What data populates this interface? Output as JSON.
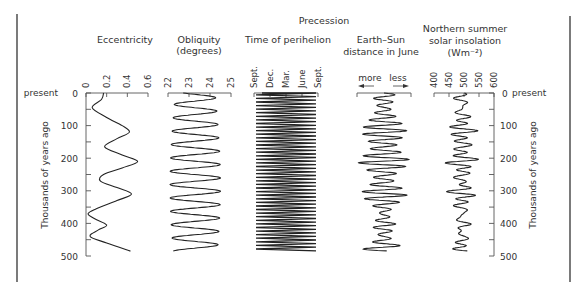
{
  "chart_data": {
    "type": "line",
    "title": "",
    "orientation": "vertical (time runs downward)",
    "y_axis": {
      "label": "Thousands of years ago",
      "ticks": [
        0,
        100,
        200,
        300,
        400,
        500
      ],
      "tick_labels": [
        "0",
        "100",
        "200",
        "300",
        "400",
        "500"
      ],
      "top_label": "present",
      "range": [
        0,
        500
      ]
    },
    "panels": [
      {
        "name": "Eccentricity",
        "title_lines": [
          "Eccentricity"
        ],
        "x_ticks": [
          "0",
          "0.2",
          "0.4",
          "0.6"
        ],
        "x_range": [
          0,
          0.06
        ],
        "series": {
          "t": [
            0,
            20,
            45,
            75,
            100,
            120,
            140,
            165,
            190,
            210,
            230,
            250,
            270,
            290,
            310,
            330,
            355,
            370,
            385,
            405,
            420,
            440,
            460,
            485
          ],
          "value": [
            0.017,
            0.015,
            0.006,
            0.02,
            0.035,
            0.042,
            0.03,
            0.018,
            0.035,
            0.05,
            0.035,
            0.017,
            0.014,
            0.03,
            0.044,
            0.03,
            0.01,
            0.002,
            0.008,
            0.02,
            0.012,
            0.004,
            0.02,
            0.043
          ]
        }
      },
      {
        "name": "Obliquity",
        "title_lines": [
          "Obliquity",
          "(degrees)"
        ],
        "x_ticks": [
          "22",
          "23",
          "24",
          "25"
        ],
        "x_range": [
          22,
          25
        ],
        "period_kyr": 41,
        "series_hint": "oscillation between ~22.1 and ~24.5 degrees with ~41 kyr period"
      },
      {
        "name": "Time of perihelion",
        "group_title": "Precession",
        "title_lines": [
          "Time of perihelion"
        ],
        "x_ticks": [
          "Sept.",
          "Dec.",
          "Mar.",
          "June",
          "Sept."
        ],
        "period_kyr": 22,
        "series_hint": "sawtooth sweeping Sept. to Sept. every ~22 kyr"
      },
      {
        "name": "Earth-Sun distance in June",
        "title_lines": [
          "Earth–Sun",
          "distance in June"
        ],
        "arrow_left": "more",
        "arrow_right": "less",
        "period_kyr": 22,
        "series_hint": "~22 kyr oscillation modulated by eccentricity"
      },
      {
        "name": "Northern summer solar insolation",
        "title_lines": [
          "Northern summer",
          "solar insolation",
          "(Wm⁻²)"
        ],
        "x_ticks": [
          "400",
          "450",
          "500",
          "550",
          "600"
        ],
        "x_range": [
          400,
          600
        ],
        "series_hint": "irregular oscillation ~440-520 W/m2, combining precession and obliquity"
      }
    ]
  }
}
